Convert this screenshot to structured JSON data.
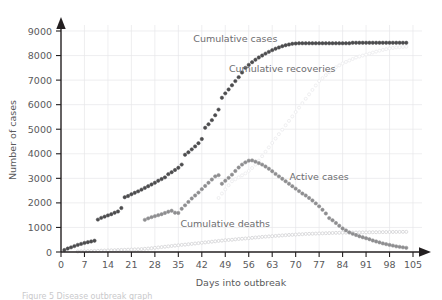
{
  "chart_data": {
    "type": "scatter",
    "title": "",
    "xlabel": "Days into outbreak",
    "ylabel": "Number of cases",
    "xlim": [
      0,
      105
    ],
    "ylim": [
      0,
      9000
    ],
    "xticks": [
      0,
      7,
      14,
      21,
      28,
      35,
      42,
      49,
      56,
      63,
      70,
      77,
      84,
      91,
      98,
      105
    ],
    "yticks": [
      0,
      1000,
      2000,
      3000,
      4000,
      5000,
      6000,
      7000,
      8000,
      9000
    ],
    "grid": true,
    "legend": "inline-annotations",
    "series": [
      {
        "name": "Cumulative cases",
        "color": "#4c4c4e",
        "marker": "filled-circle",
        "label_x": 52,
        "label_y": 8550,
        "x": [
          1,
          2,
          3,
          4,
          5,
          6,
          7,
          8,
          9,
          10,
          11,
          12,
          13,
          14,
          15,
          16,
          17,
          18,
          19,
          20,
          21,
          22,
          23,
          24,
          25,
          26,
          27,
          28,
          29,
          30,
          31,
          32,
          33,
          34,
          35,
          36,
          37,
          38,
          39,
          40,
          41,
          42,
          43,
          44,
          45,
          46,
          47,
          48,
          49,
          50,
          51,
          52,
          53,
          54,
          55,
          56,
          57,
          58,
          59,
          60,
          61,
          62,
          63,
          64,
          65,
          66,
          67,
          68,
          69,
          70,
          71,
          72,
          73,
          74,
          75,
          76,
          77,
          78,
          79,
          80,
          81,
          82,
          83,
          84,
          85,
          86,
          87,
          88,
          89,
          90,
          91,
          92,
          93,
          94,
          95,
          96,
          97,
          98,
          99,
          100,
          101,
          102,
          103
        ],
        "y": [
          80,
          140,
          190,
          240,
          290,
          330,
          370,
          400,
          430,
          460,
          1320,
          1390,
          1440,
          1490,
          1540,
          1600,
          1650,
          1790,
          2230,
          2280,
          2350,
          2410,
          2470,
          2540,
          2610,
          2680,
          2750,
          2820,
          2900,
          2970,
          3040,
          3170,
          3250,
          3340,
          3430,
          3560,
          3960,
          4060,
          4180,
          4300,
          4430,
          4600,
          5060,
          5200,
          5370,
          5570,
          5800,
          6280,
          6460,
          6620,
          6790,
          6960,
          7120,
          7310,
          7500,
          7620,
          7730,
          7830,
          7920,
          8000,
          8080,
          8150,
          8220,
          8280,
          8330,
          8380,
          8420,
          8450,
          8480,
          8490,
          8500,
          8500,
          8500,
          8500,
          8500,
          8500,
          8500,
          8500,
          8500,
          8500,
          8500,
          8500,
          8500,
          8500,
          8500,
          8500,
          8520,
          8520,
          8520,
          8520,
          8520,
          8520,
          8520,
          8520,
          8520,
          8520,
          8520,
          8520,
          8520,
          8520,
          8520,
          8520,
          8520
        ]
      },
      {
        "name": "Cumulative recoveries",
        "color": "#ececee",
        "marker": "open-circle",
        "label_x": 66,
        "label_y": 7350,
        "x": [
          47,
          48,
          49,
          50,
          51,
          52,
          53,
          54,
          55,
          56,
          57,
          58,
          59,
          60,
          61,
          62,
          63,
          64,
          65,
          66,
          67,
          68,
          69,
          70,
          71,
          72,
          73,
          74,
          75,
          76,
          77,
          78,
          79,
          80,
          81,
          82,
          83,
          84,
          85,
          86,
          87,
          88,
          89,
          90,
          91,
          92,
          93,
          94,
          95,
          96,
          97,
          98,
          99,
          100,
          101,
          102,
          103
        ],
        "y": [
          2200,
          2380,
          2550,
          2720,
          2880,
          2960,
          3040,
          3120,
          3200,
          3300,
          3420,
          3560,
          3720,
          3900,
          4080,
          4260,
          4440,
          4620,
          4800,
          4980,
          5160,
          5340,
          5520,
          5700,
          5880,
          6060,
          6240,
          6420,
          6600,
          6780,
          6960,
          7080,
          7200,
          7320,
          7420,
          7520,
          7600,
          7680,
          7740,
          7800,
          7860,
          7920,
          7960,
          8000,
          8040,
          8080,
          8120,
          8160,
          8200,
          8230,
          8260,
          8290,
          8310,
          8330,
          8340,
          8350,
          8360
        ]
      },
      {
        "name": "Active cases",
        "color": "#8e8e90",
        "marker": "filled-circle",
        "label_x": 77,
        "label_y": 2950,
        "x": [
          25,
          26,
          27,
          28,
          29,
          30,
          31,
          32,
          33,
          34,
          35,
          36,
          37,
          38,
          39,
          40,
          41,
          42,
          43,
          44,
          45,
          46,
          47,
          48,
          49,
          50,
          51,
          52,
          53,
          54,
          55,
          56,
          57,
          58,
          59,
          60,
          61,
          62,
          63,
          64,
          65,
          66,
          67,
          68,
          69,
          70,
          71,
          72,
          73,
          74,
          75,
          76,
          77,
          78,
          79,
          80,
          81,
          82,
          83,
          84,
          85,
          86,
          87,
          88,
          89,
          90,
          91,
          92,
          93,
          94,
          95,
          96,
          97,
          98,
          99,
          100,
          101,
          102,
          103
        ],
        "y": [
          1310,
          1370,
          1420,
          1460,
          1500,
          1540,
          1590,
          1640,
          1680,
          1600,
          1590,
          1760,
          1900,
          2040,
          2180,
          2300,
          2420,
          2560,
          2690,
          2820,
          2950,
          3080,
          3130,
          2780,
          2900,
          3020,
          3150,
          3300,
          3440,
          3560,
          3650,
          3720,
          3730,
          3680,
          3620,
          3560,
          3480,
          3390,
          3290,
          3180,
          3080,
          2980,
          2880,
          2780,
          2680,
          2580,
          2480,
          2380,
          2300,
          2200,
          2100,
          1980,
          1860,
          1720,
          1570,
          1380,
          1290,
          1180,
          1070,
          960,
          880,
          800,
          740,
          690,
          640,
          600,
          560,
          520,
          470,
          430,
          390,
          350,
          320,
          290,
          260,
          230,
          210,
          190,
          170
        ]
      },
      {
        "name": "Cumulative deaths",
        "color": "#d6d6d8",
        "marker": "open-circle",
        "label_x": 49,
        "label_y": 1020,
        "x": [
          5,
          6,
          7,
          8,
          9,
          10,
          11,
          12,
          13,
          14,
          15,
          16,
          17,
          18,
          19,
          20,
          21,
          22,
          23,
          24,
          25,
          26,
          27,
          28,
          29,
          30,
          31,
          32,
          33,
          34,
          35,
          36,
          37,
          38,
          39,
          40,
          41,
          42,
          43,
          44,
          45,
          46,
          47,
          48,
          49,
          50,
          51,
          52,
          53,
          54,
          55,
          56,
          57,
          58,
          59,
          60,
          61,
          62,
          63,
          64,
          65,
          66,
          67,
          68,
          69,
          70,
          71,
          72,
          73,
          74,
          75,
          76,
          77,
          78,
          79,
          80,
          81,
          82,
          83,
          84,
          85,
          86,
          87,
          88,
          89,
          90,
          91,
          92,
          93,
          94,
          95,
          96,
          97,
          98,
          99,
          100,
          101,
          102,
          103
        ],
        "y": [
          20,
          25,
          30,
          35,
          40,
          45,
          50,
          55,
          60,
          65,
          70,
          75,
          80,
          85,
          90,
          95,
          100,
          105,
          110,
          120,
          130,
          140,
          155,
          170,
          185,
          200,
          215,
          230,
          245,
          260,
          275,
          290,
          300,
          315,
          330,
          345,
          360,
          375,
          390,
          405,
          420,
          435,
          450,
          465,
          480,
          490,
          500,
          515,
          530,
          540,
          550,
          560,
          575,
          590,
          600,
          615,
          625,
          635,
          645,
          655,
          665,
          675,
          685,
          695,
          700,
          710,
          720,
          725,
          735,
          740,
          745,
          750,
          755,
          760,
          765,
          770,
          775,
          780,
          782,
          785,
          788,
          790,
          792,
          794,
          796,
          798,
          800,
          802,
          804,
          806,
          808,
          810,
          812,
          814,
          816,
          818,
          818,
          820,
          820
        ]
      }
    ]
  },
  "caption": {
    "text": "Figure 5  Disease outbreak graph"
  }
}
